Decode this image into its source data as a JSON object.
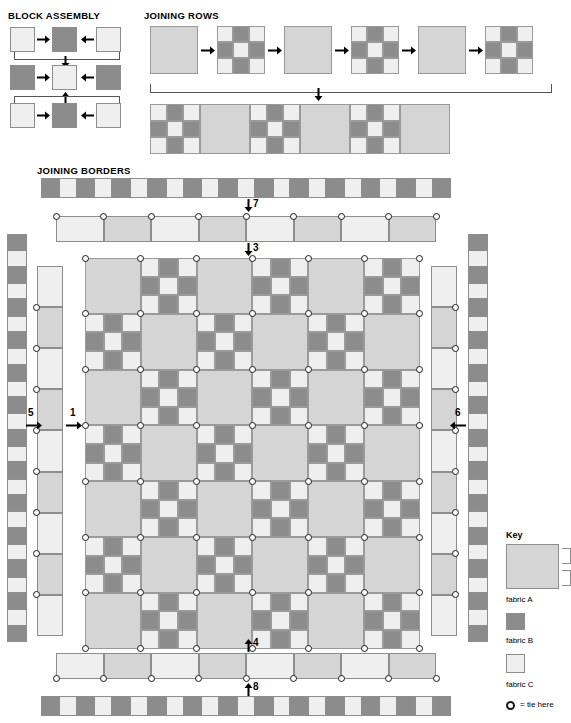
{
  "sections": {
    "block_assembly": {
      "title": "BLOCK ASSEMBLY",
      "rows": [
        {
          "cells": [
            "C",
            "B",
            "C"
          ]
        },
        {
          "cells": [
            "B",
            "C",
            "B"
          ]
        },
        {
          "cells": [
            "C",
            "B",
            "C"
          ]
        }
      ]
    },
    "joining_rows": {
      "title": "JOINING ROWS",
      "sequence": [
        "plain",
        "ninepatch",
        "plain",
        "ninepatch",
        "plain",
        "ninepatch"
      ],
      "result_row": [
        "ninepatch",
        "plain",
        "ninepatch",
        "plain",
        "ninepatch",
        "plain"
      ]
    },
    "joining_borders": {
      "title": "JOINING BORDERS"
    }
  },
  "block": {
    "nine_patch_layout": [
      [
        "C",
        "B",
        "C"
      ],
      [
        "B",
        "C",
        "B"
      ],
      [
        "C",
        "B",
        "C"
      ]
    ],
    "plain_fabric": "A"
  },
  "quilt_body": {
    "columns": 6,
    "rows": 7,
    "pattern_note": "alternating plain A blocks and nine-patch blocks in checkerboard",
    "first_cell_type": "plain"
  },
  "borders": {
    "checker_top_count": 23,
    "checker_bottom_count": 23,
    "checker_side_count": 25,
    "inner_top_count": 8,
    "inner_bottom_count": 8,
    "inner_side_count": 9
  },
  "step_numbers": {
    "left_inner": "1",
    "right_inner": "2",
    "top_inner": "3",
    "bottom_inner": "4",
    "left_outer": "5",
    "right_outer": "6",
    "top_outer": "7",
    "bottom_outer": "8"
  },
  "key": {
    "title": "Key",
    "items": [
      {
        "label": "fabric A",
        "fabric": "A"
      },
      {
        "label": "fabric B",
        "fabric": "B"
      },
      {
        "label": "fabric C",
        "fabric": "C"
      }
    ],
    "tie_label": "= tie here"
  },
  "colors": {
    "fabric_a": "#d5d5d5",
    "fabric_b": "#8c8c8c",
    "fabric_c": "#efefef",
    "outline": "#8d8d8d",
    "ink": "#000000"
  }
}
